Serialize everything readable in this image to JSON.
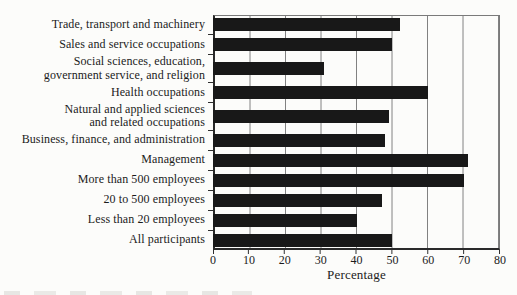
{
  "chart_data": {
    "type": "bar",
    "orientation": "horizontal",
    "title": "",
    "xlabel": "Percentage",
    "xlim": [
      0,
      80
    ],
    "xticks": [
      0,
      10,
      20,
      30,
      40,
      50,
      60,
      70,
      80
    ],
    "grid": "vertical-gridlines-every-10",
    "legend": "none",
    "bar_color": "#181818",
    "background_color": "#fcfcfa",
    "categories": [
      "Trade, transport and machinery",
      "Sales and service occupations",
      "Social sciences, education,\ngovernment service, and religion",
      "Health occupations",
      "Natural and applied sciences\nand related occupations",
      "Business, finance, and administration",
      "Management",
      "More than 500 employees",
      "20 to 500 employees",
      "Less than 20 employees",
      "All participants"
    ],
    "values": [
      52,
      50,
      31,
      60,
      49,
      48,
      71,
      70,
      47,
      40,
      50
    ]
  }
}
